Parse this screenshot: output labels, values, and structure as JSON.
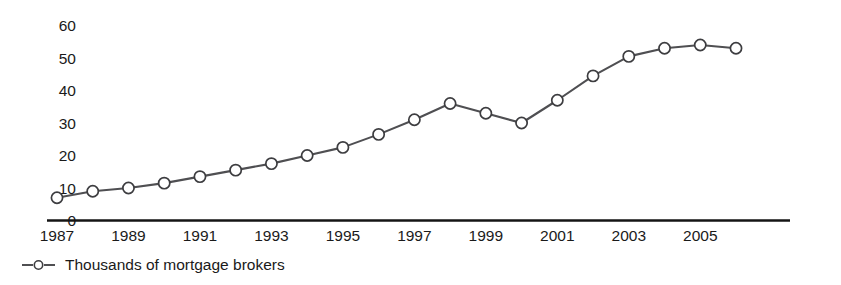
{
  "chart_data": {
    "type": "line",
    "title": "",
    "subtitle": "",
    "xlabel": "",
    "ylabel": "",
    "grid": false,
    "legend_position": "bottom-left",
    "xlim": [
      1987,
      2006
    ],
    "ylim": [
      0,
      60
    ],
    "y_ticks": [
      0,
      10,
      20,
      30,
      40,
      50,
      60
    ],
    "y_tick_labels": [
      "0",
      "10",
      "20",
      "30",
      "40",
      "50",
      "60"
    ],
    "x_ticks": [
      1987,
      1989,
      1991,
      1993,
      1995,
      1997,
      1999,
      2001,
      2003,
      2005
    ],
    "x_tick_labels": [
      "1987",
      "1989",
      "1991",
      "1993",
      "1995",
      "1997",
      "1999",
      "2001",
      "2003",
      "2005"
    ],
    "x": [
      1987,
      1988,
      1989,
      1990,
      1991,
      1992,
      1993,
      1994,
      1995,
      1996,
      1997,
      1998,
      1999,
      2000,
      2001,
      2002,
      2003,
      2004,
      2005,
      2006
    ],
    "series": [
      {
        "name": "Thousands of mortgage brokers",
        "marker": "open-circle",
        "color": "#4f4f52",
        "values": [
          7,
          9,
          10,
          11.5,
          13.5,
          15.5,
          17.5,
          20,
          22.5,
          26.5,
          31,
          36,
          33,
          30,
          37,
          44.5,
          50.5,
          53,
          54,
          53
        ]
      }
    ],
    "annotations": []
  },
  "legend": {
    "entries": [
      {
        "label": "Thousands of mortgage brokers",
        "marker": "open-circle",
        "color": "#4f4f52"
      }
    ]
  },
  "colors": {
    "line": "#4f4f52",
    "marker_fill": "#ffffff",
    "marker_stroke": "#3d3d40",
    "axis": "#141414",
    "text": "#1a1a1a",
    "background": "#ffffff"
  }
}
